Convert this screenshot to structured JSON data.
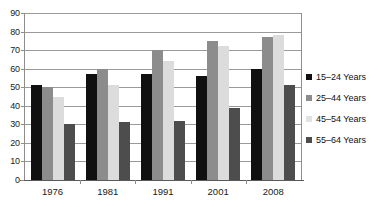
{
  "chart_data": {
    "type": "bar",
    "title": "",
    "xlabel": "",
    "ylabel": "",
    "ylim": [
      0,
      90
    ],
    "y_ticks": [
      0,
      10,
      20,
      30,
      40,
      50,
      60,
      70,
      80,
      90
    ],
    "grid": true,
    "legend_position": "right",
    "categories": [
      "1976",
      "1981",
      "1991",
      "2001",
      "2008"
    ],
    "series": [
      {
        "name": "15–24 Years",
        "color": "#101010",
        "values": [
          51,
          57,
          57,
          56,
          60
        ]
      },
      {
        "name": "25–44 Years",
        "color": "#8c8c8c",
        "values": [
          50,
          60,
          70,
          75,
          77
        ]
      },
      {
        "name": "45–54 Years",
        "color": "#dcdcdc",
        "values": [
          45,
          51,
          64,
          72,
          78
        ]
      },
      {
        "name": "55–64 Years",
        "color": "#4d4d4d",
        "values": [
          30,
          31,
          32,
          39,
          51
        ]
      }
    ]
  },
  "axis": {
    "y_tick_labels": [
      "90",
      "80",
      "70",
      "60",
      "50",
      "40",
      "30",
      "20",
      "10",
      "0"
    ],
    "x_tick_labels": [
      "1976",
      "1981",
      "1991",
      "2001",
      "2008"
    ]
  },
  "legend": {
    "items": [
      {
        "label": "15–24 Years",
        "swatch": "series-0-swatch"
      },
      {
        "label": "25–44 Years",
        "swatch": "series-1-swatch"
      },
      {
        "label": "45–54 Years",
        "swatch": "series-2-swatch"
      },
      {
        "label": "55–64 Years",
        "swatch": "series-3-swatch"
      }
    ]
  }
}
